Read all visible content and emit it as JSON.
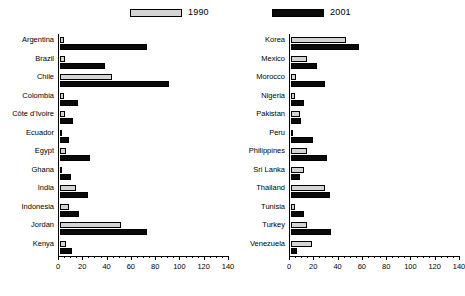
{
  "chart_data": {
    "type": "bar",
    "orientation": "horizontal",
    "title": "",
    "xlabel": "",
    "ylabel": "",
    "xlim": [
      0,
      140
    ],
    "xticks": [
      0,
      20,
      40,
      60,
      80,
      100,
      120,
      140
    ],
    "xtick_labels": [
      "0",
      "20",
      "40",
      "60",
      "80",
      "100",
      "120",
      "140"
    ],
    "grid": false,
    "legend": {
      "position": "top",
      "entries": [
        {
          "name": "1990",
          "color": "#d4d4d4"
        },
        {
          "name": "2001",
          "color": "#0a0a0a"
        }
      ]
    },
    "panels": [
      {
        "name": "left-panel",
        "categories": [
          "Argentina",
          "Brazil",
          "Chile",
          "Colombia",
          "Côte d'Ivoire",
          "Ecuador",
          "Egypt",
          "Ghana",
          "India",
          "Indonesia",
          "Jordan",
          "Kenya"
        ],
        "series": [
          {
            "name": "1990",
            "color": "#d4d4d4",
            "values": [
              3,
              4,
              43,
              3,
              4,
              1,
              5,
              1,
              13,
              7,
              50,
              5
            ]
          },
          {
            "name": "2001",
            "color": "#0a0a0a",
            "values": [
              72,
              37,
              90,
              15,
              11,
              7,
              25,
              9,
              23,
              16,
              72,
              10
            ]
          }
        ]
      },
      {
        "name": "right-panel",
        "categories": [
          "Korea",
          "Mexico",
          "Morocco",
          "Nigeria",
          "Pakistan",
          "Peru",
          "Philippines",
          "Sri Lanka",
          "Thailand",
          "Tunisia",
          "Turkey",
          "Venezuela"
        ],
        "series": [
          {
            "name": "1990",
            "color": "#d4d4d4",
            "values": [
              45,
              13,
              4,
              3,
              7,
              2,
              13,
              11,
              28,
              3,
              13,
              17
            ]
          },
          {
            "name": "2001",
            "color": "#0a0a0a",
            "values": [
              56,
              21,
              28,
              11,
              8,
              18,
              30,
              7,
              32,
              11,
              33,
              5
            ]
          }
        ]
      }
    ]
  }
}
